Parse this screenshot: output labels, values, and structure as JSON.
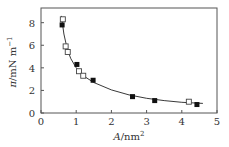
{
  "chart_data": {
    "type": "scatter",
    "title": "",
    "xlabel": "A/nm²",
    "ylabel": "π/mN m⁻¹",
    "xlabel_parts": {
      "symbol": "A",
      "unit": "/nm",
      "sup": "2"
    },
    "ylabel_parts": {
      "symbol": "π",
      "unit": "/mN m",
      "sup": "−1"
    },
    "xlim": [
      0,
      5
    ],
    "ylim": [
      0,
      9.3
    ],
    "xticks": [
      0,
      1,
      2,
      3,
      4,
      5
    ],
    "yticks": [
      0,
      2,
      4,
      6,
      8
    ],
    "grid": false,
    "legend": null,
    "series": [
      {
        "name": "filled squares",
        "marker": "filled-square",
        "color": "#111111",
        "x": [
          0.6,
          1.02,
          1.48,
          2.6,
          3.23,
          4.43
        ],
        "y": [
          7.8,
          4.3,
          2.9,
          1.45,
          1.1,
          0.75
        ]
      },
      {
        "name": "open squares",
        "marker": "open-square",
        "color": "#444444",
        "x": [
          0.62,
          0.7,
          0.76,
          1.08,
          1.2,
          4.2
        ],
        "y": [
          8.3,
          5.9,
          5.4,
          3.7,
          3.3,
          1.0
        ]
      },
      {
        "name": "fit curve",
        "marker": "line",
        "color": "#222222",
        "x": [
          0.58,
          0.65,
          0.75,
          0.85,
          1.0,
          1.2,
          1.5,
          2.0,
          2.5,
          3.0,
          3.5,
          4.0,
          4.6
        ],
        "y": [
          8.6,
          7.0,
          5.6,
          4.8,
          4.0,
          3.3,
          2.7,
          2.05,
          1.6,
          1.3,
          1.1,
          0.95,
          0.85
        ]
      }
    ]
  }
}
